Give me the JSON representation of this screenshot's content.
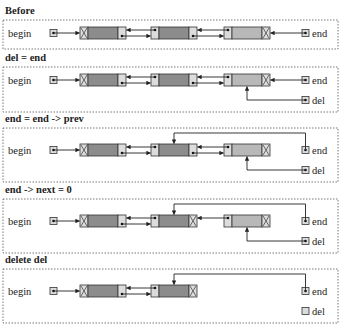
{
  "diagram": {
    "type": "doubly-linked-list-delete-last",
    "colors": {
      "node_dark": "#8c8c8c",
      "node_light": "#b8b8b8",
      "pointer_cell": "#dcdcdc",
      "line": "#222222",
      "frame": "#555555"
    },
    "labels": {
      "begin": "begin",
      "end": "end",
      "del": "del"
    },
    "panels": [
      {
        "title": "Before",
        "nodes": [
          "dark",
          "dark",
          "light"
        ],
        "node_links": [
          {
            "prev_null": true,
            "next_null": false
          },
          {
            "prev_null": false,
            "next_null": false
          },
          {
            "prev_null": false,
            "next_null": true
          }
        ],
        "end_points_to": 2,
        "del_points_to": null,
        "show_del": false,
        "del_empty": false,
        "node3_linked_from_node2": true
      },
      {
        "title": "del = end",
        "nodes": [
          "dark",
          "dark",
          "light"
        ],
        "end_points_to": 2,
        "del_points_to": 2,
        "show_del": true,
        "del_empty": false,
        "node3_linked_from_node2": true
      },
      {
        "title": "end = end -> prev",
        "nodes": [
          "dark",
          "dark",
          "light"
        ],
        "end_points_to": 1,
        "del_points_to": 2,
        "show_del": true,
        "del_empty": false,
        "node3_linked_from_node2": true
      },
      {
        "title": "end -> next = 0",
        "nodes": [
          "dark",
          "dark",
          "light"
        ],
        "end_points_to": 1,
        "del_points_to": 2,
        "show_del": true,
        "del_empty": false,
        "node3_linked_from_node2": false
      },
      {
        "title": "delete del",
        "nodes": [
          "dark",
          "dark"
        ],
        "end_points_to": 1,
        "del_points_to": null,
        "show_del": true,
        "del_empty": true,
        "node3_linked_from_node2": false
      }
    ]
  }
}
